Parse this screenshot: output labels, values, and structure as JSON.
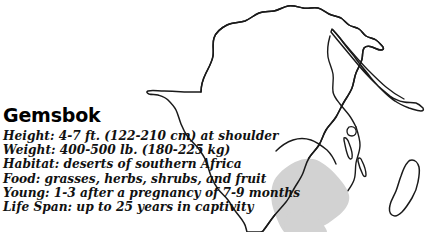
{
  "card": {
    "species_name": "Gemsbok",
    "facts": [
      {
        "label": "Height:",
        "value": "4-7 ft. (122-210 cm) at shoulder"
      },
      {
        "label": "Weight:",
        "value": "400-500 lb. (180-225 kg)"
      },
      {
        "label": "Habitat:",
        "value": "deserts of southern Africa"
      },
      {
        "label": "Food:",
        "value": "grasses, herbs, shrubs, and fruit"
      },
      {
        "label": "Young:",
        "value": "1-3 after a pregnancy of 7-9 months"
      },
      {
        "label": "Life Span:",
        "value": "up to 25 years in captivity"
      }
    ]
  },
  "map": {
    "continent": "Africa",
    "range_shading_label": "southern Africa range",
    "colors": {
      "coastline": "#1a1a1a",
      "land_fill": "#ffffff",
      "range_fill": "#d2d2d2",
      "background": "#ffffff"
    }
  }
}
